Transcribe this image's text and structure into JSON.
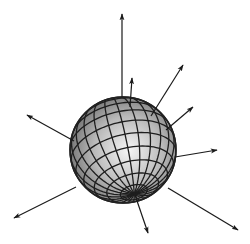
{
  "figure": {
    "background": "#ffffff",
    "line_color": "#1a1a1a",
    "sphere": {
      "cx": 123,
      "cy": 150,
      "r": 53,
      "highlight_color": "#f4f4f4",
      "mid_color": "#b8b8b8",
      "shadow_color": "#5a5a5a"
    },
    "arrows": [
      {
        "name": "arrow-top",
        "x1": 122,
        "y1": 97,
        "x2": 122,
        "y2": 14
      },
      {
        "name": "arrow-top-short",
        "x1": 130,
        "y1": 107,
        "x2": 132,
        "y2": 78
      },
      {
        "name": "arrow-upper-right",
        "x1": 151,
        "y1": 116,
        "x2": 183,
        "y2": 65
      },
      {
        "name": "arrow-right-upper",
        "x1": 166,
        "y1": 130,
        "x2": 193,
        "y2": 107
      },
      {
        "name": "arrow-right",
        "x1": 175,
        "y1": 157,
        "x2": 217,
        "y2": 150
      },
      {
        "name": "arrow-lower-right",
        "x1": 168,
        "y1": 188,
        "x2": 238,
        "y2": 230
      },
      {
        "name": "arrow-bottom",
        "x1": 135,
        "y1": 195,
        "x2": 148,
        "y2": 233
      },
      {
        "name": "arrow-lower-left",
        "x1": 76,
        "y1": 187,
        "x2": 14,
        "y2": 218
      },
      {
        "name": "arrow-left",
        "x1": 74,
        "y1": 141,
        "x2": 27,
        "y2": 115
      }
    ]
  }
}
